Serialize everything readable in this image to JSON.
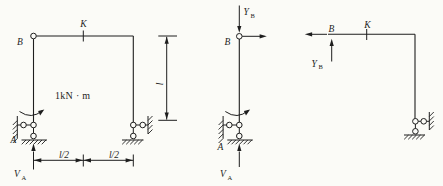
{
  "figure": {
    "background": "#fbfbf7",
    "ink": "#1e1e1e",
    "left_diagram": {
      "node_b": "B",
      "node_k": "K",
      "node_a": "A",
      "moment_load": "1kN · m",
      "reaction_sym": "V",
      "reaction_sub": "A",
      "dim_height": "l",
      "dim_span_left": "l/2",
      "dim_span_right": "l/2"
    },
    "middle_diagram": {
      "node_b": "B",
      "node_a": "A",
      "force_sym": "Y",
      "force_sub": "B",
      "reaction_sym": "V",
      "reaction_sub": "A"
    },
    "right_diagram": {
      "node_b": "B",
      "node_k": "K",
      "force_sym": "Y",
      "force_sub": "B"
    }
  }
}
